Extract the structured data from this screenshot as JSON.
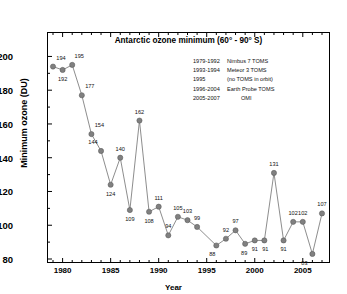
{
  "chart_data": {
    "type": "line",
    "title": "Antarctic ozone minimum (60° - 90° S)",
    "xlabel": "Year",
    "ylabel": "Minimum ozone (DU)",
    "xlim": [
      1979,
      2007
    ],
    "ylim": [
      80,
      205
    ],
    "xticks": [
      1980,
      1985,
      1990,
      1995,
      2000,
      2005
    ],
    "yticks": [
      80,
      100,
      120,
      140,
      160,
      180,
      200
    ],
    "grid": false,
    "legend_position": "upper-right",
    "marker": "circle",
    "marker_color": "#808080",
    "line_color": "#808080",
    "x": [
      1979,
      1980,
      1981,
      1982,
      1983,
      1984,
      1985,
      1986,
      1987,
      1988,
      1989,
      1990,
      1991,
      1992,
      1993,
      1994,
      1996,
      1997,
      1998,
      1999,
      2000,
      2001,
      2002,
      2003,
      2004,
      2005,
      2006,
      2007
    ],
    "values": [
      194,
      192,
      195,
      177,
      154,
      144,
      124,
      140,
      109,
      162,
      108,
      111,
      94,
      105,
      103,
      99,
      88,
      92,
      97,
      89,
      91,
      91,
      131,
      91,
      102,
      102,
      83,
      107
    ],
    "point_labels": [
      "194",
      "192",
      "195",
      "177",
      "154",
      "144",
      "124",
      "140",
      "109",
      "162",
      "108",
      "111",
      "94",
      "105",
      "103",
      "99",
      "88",
      "92",
      "97",
      "89",
      "91",
      "91",
      "131",
      "91",
      "102",
      "102",
      "83",
      "107"
    ],
    "missing_years": [
      1995
    ],
    "annotations": [
      {
        "years": "1979-1992",
        "instrument": "Nimbus 7 TOMS"
      },
      {
        "years": "1993-1994",
        "instrument": "Meteor 3 TOMS"
      },
      {
        "years": "1995",
        "instrument": "(no TOMS in orbit)"
      },
      {
        "years": "1996-2004",
        "instrument": "Earth Probe TOMS"
      },
      {
        "years": "2005-2007",
        "instrument": "OMI"
      }
    ]
  },
  "legend": {
    "rows": [
      {
        "years": "1979-1992",
        "instrument": "Nimbus 7 TOMS"
      },
      {
        "years": "1993-1994",
        "instrument": "Meteor 3 TOMS"
      },
      {
        "years": "1995",
        "instrument": "(no TOMS in orbit)"
      },
      {
        "years": "1996-2004",
        "instrument": "Earth Probe TOMS"
      },
      {
        "years": "2005-2007",
        "instrument": "OMI"
      }
    ]
  }
}
